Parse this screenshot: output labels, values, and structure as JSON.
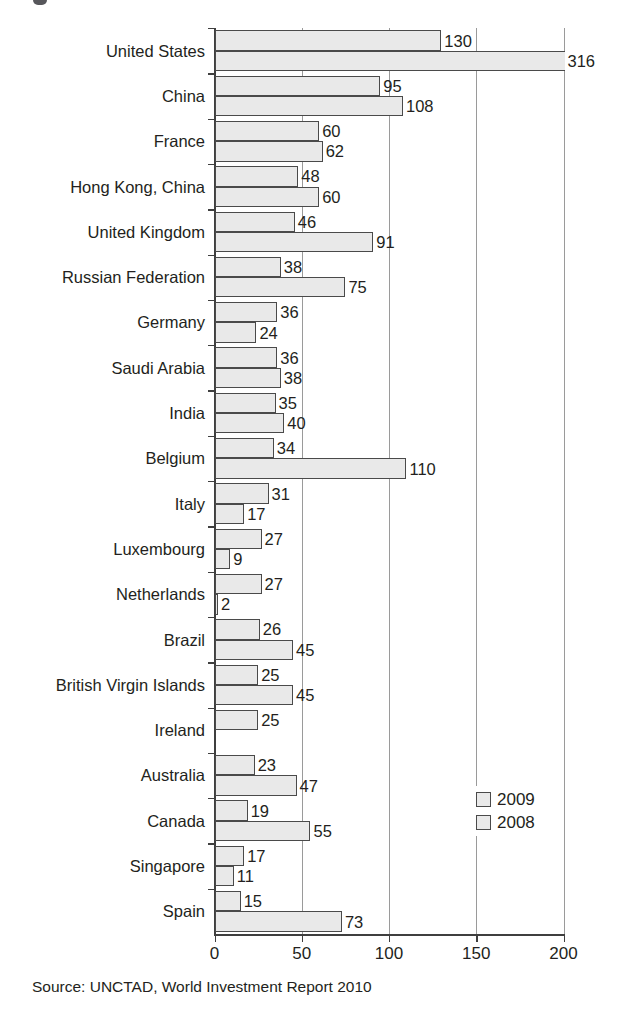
{
  "chart_data": {
    "type": "bar",
    "orientation": "horizontal",
    "title": "",
    "xlabel": "",
    "ylabel": "",
    "xlim": [
      0,
      200
    ],
    "xticks": [
      0,
      50,
      100,
      150,
      200
    ],
    "xticklabels": [
      "0",
      "50",
      "100",
      "150",
      "200"
    ],
    "grid": true,
    "grid_axis": "x",
    "legend_position": "bottom-right",
    "categories": [
      "United States",
      "China",
      "France",
      "Hong Kong, China",
      "United Kingdom",
      "Russian Federation",
      "Germany",
      "Saudi Arabia",
      "India",
      "Belgium",
      "Italy",
      "Luxembourg",
      "Netherlands",
      "Brazil",
      "British Virgin Islands",
      "Ireland",
      "Australia",
      "Canada",
      "Singapore",
      "Spain"
    ],
    "series": [
      {
        "name": "2009",
        "color": "#e9e9e9",
        "values": [
          130,
          95,
          60,
          48,
          46,
          38,
          36,
          36,
          35,
          34,
          31,
          27,
          27,
          26,
          25,
          25,
          23,
          19,
          17,
          15
        ]
      },
      {
        "name": "2008",
        "color": "#e9e9e9",
        "values": [
          316,
          108,
          62,
          60,
          91,
          75,
          24,
          38,
          40,
          110,
          17,
          9,
          2,
          45,
          45,
          0,
          47,
          55,
          11,
          73
        ]
      }
    ],
    "datalabels_2009": [
      "130",
      "95",
      "60",
      "48",
      "46",
      "38",
      "36",
      "36",
      "35",
      "34",
      "31",
      "27",
      "27",
      "26",
      "25",
      "25",
      "23",
      "19",
      "17",
      "15"
    ],
    "datalabels_2008": [
      "316",
      "108",
      "62",
      "60",
      "91",
      "75",
      "24",
      "38",
      "40",
      "110",
      "17",
      "9",
      "2",
      "45",
      "45",
      "",
      "47",
      "55",
      "11",
      "73"
    ]
  },
  "legend": {
    "items": [
      {
        "label": "2009",
        "color": "#e9e9e9"
      },
      {
        "label": "2008",
        "color": "#e9e9e9"
      }
    ]
  },
  "source": {
    "text": "Source: UNCTAD, World Investment Report 2010"
  },
  "axis": {
    "tick_labels": [
      "0",
      "50",
      "100",
      "150",
      "200"
    ]
  },
  "colors": {
    "bar_fill": "#e9e9e9",
    "bar_stroke": "#4a4a4a",
    "gridline": "#9a9a9a",
    "axis": "#3f3f3f",
    "text": "#231f20",
    "background": "#ffffff"
  }
}
